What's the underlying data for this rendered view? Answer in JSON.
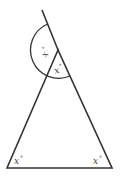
{
  "diagram": {
    "type": "triangle-with-exterior-angle",
    "stroke_color": "#333333",
    "labels": {
      "exterior_angle": "x°",
      "apex_interior_angle": "x°",
      "bottom_left_angle": "x°",
      "bottom_right_angle": "x°"
    },
    "label_parts": {
      "variable": "x",
      "degree": "°"
    }
  }
}
